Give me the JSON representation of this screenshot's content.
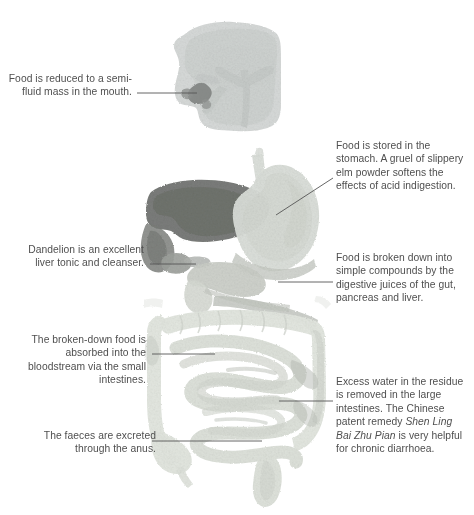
{
  "diagram": {
    "background_color": "#ffffff",
    "text_color": "#4f4f4f",
    "leader_line_color": "#555555"
  },
  "callouts": [
    {
      "id": "mouth",
      "side": "left",
      "text": "Food is reduced to a semi-fluid mass in the mouth.",
      "target_organ": "mouth"
    },
    {
      "id": "stomach",
      "side": "right",
      "text": "Food is stored in the stomach. A gruel of slippery elm powder softens the effects of acid indigestion.",
      "target_organ": "stomach"
    },
    {
      "id": "liver",
      "side": "left",
      "text": "Dandelion is an excellent liver tonic and cleanser.",
      "target_organ": "liver"
    },
    {
      "id": "breakdown",
      "side": "right",
      "text": "Food is broken down into simple compounds by the digestive juices of the gut, pancreas and liver.",
      "target_organ": "duodenum"
    },
    {
      "id": "small-intestine",
      "side": "left",
      "text": "The broken-down food is absorbed into the bloodstream via the small intestines.",
      "target_organ": "small-intestine"
    },
    {
      "id": "large-intestine",
      "side": "right",
      "text_before": "Excess water in the residue is removed in the large intestines. The Chinese patent remedy ",
      "text_italic": "Shen Ling Bai Zhu Pian",
      "text_after": " is very helpful for chronic diarrhoea.",
      "target_organ": "large-intestine"
    },
    {
      "id": "faeces",
      "side": "left",
      "text": "The faeces are excreted through the anus.",
      "target_organ": "rectum"
    }
  ],
  "organs": {
    "head_mouth": {
      "label": "head and mouth",
      "fill": "#d2d5d4"
    },
    "tongue": {
      "label": "tongue",
      "fill": "#babdbd"
    },
    "airway": {
      "label": "airway and bronchi",
      "fill": "#c3c7c5"
    },
    "dark_spot": {
      "label": "oral cavity marking",
      "fill": "#8a8d8b"
    },
    "oesophagus": {
      "label": "oesophagus",
      "fill": "#d8dcd8"
    },
    "liver": {
      "label": "liver",
      "fill": "#6f7270"
    },
    "gallbladder": {
      "label": "gallbladder",
      "fill": "#a9acaa"
    },
    "stomach": {
      "label": "stomach",
      "fill": "#d9ddd7"
    },
    "duodenum": {
      "label": "duodenum and pancreas",
      "fill": "#c8ccc6"
    },
    "small_intestine": {
      "label": "small intestines",
      "fill": "#dfe3dd"
    },
    "large_intestine": {
      "label": "large intestines",
      "fill": "#e3e7e0"
    },
    "rectum": {
      "label": "rectum and anus",
      "fill": "#dde1da"
    }
  }
}
